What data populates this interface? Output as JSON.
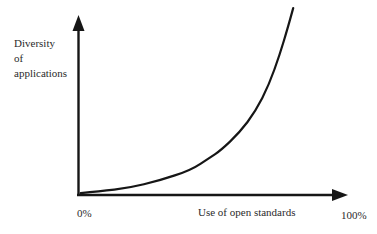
{
  "figure": {
    "ylabel_line1": "Diversity",
    "ylabel_line2": "of",
    "ylabel_line3": "applications",
    "xlabel": "Use of open standards",
    "origin_label": "0%",
    "xmax_label": "100%",
    "line_color": "#161616",
    "text_color": "#2b2b2b",
    "background_color": "#ffffff"
  },
  "chart_data": {
    "type": "line",
    "title": "",
    "xlabel": "Use of open standards",
    "ylabel": "Diversity of applications",
    "xlim": [
      0,
      100
    ],
    "x_tick_labels": [
      "0%",
      "100%"
    ],
    "y_tick_labels": [],
    "grid": false,
    "legend": false,
    "shape": "exponential-growth",
    "axes": "arrow-style, origin at 0%",
    "series": [
      {
        "name": "diversity-vs-open-standards",
        "x": [
          1,
          8,
          19,
          30,
          42,
          49,
          53,
          60,
          66,
          71,
          75,
          78,
          80
        ],
        "y": [
          1,
          2,
          4,
          8,
          14,
          21,
          25,
          35,
          47,
          62,
          79,
          94,
          105
        ],
        "y_unit": "relative diversity (100 = y-axis arrow tip)"
      }
    ]
  }
}
